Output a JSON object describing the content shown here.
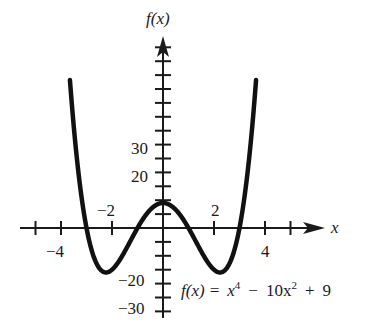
{
  "chart_data": {
    "type": "line",
    "title": "",
    "xlabel": "x",
    "ylabel": "f(x)",
    "equation": "f(x) = x^4 - 10x^2 + 9",
    "equation_parts": {
      "lhs": "f(x) =",
      "x4": "x",
      "exp4": "4",
      "minus": "−",
      "c10": "10x",
      "exp2": "2",
      "plus": "+",
      "nine": "9"
    },
    "x_tick_labels": [
      "−4",
      "−2",
      "2",
      "4"
    ],
    "x_tick_values": [
      -5,
      -4,
      -2,
      2,
      4,
      5
    ],
    "y_tick_labels": [
      "30",
      "20",
      "−20",
      "−30"
    ],
    "y_tick_step": 5,
    "xlim": [
      -5.2,
      6.5
    ],
    "ylim": [
      -32,
      72
    ],
    "grid": false,
    "legend": "none",
    "series": [
      {
        "name": "f(x) = x^4 - 10x^2 + 9",
        "x": [
          -3.65,
          -3.5,
          -3.25,
          -3.0,
          -2.75,
          -2.5,
          -2.236,
          -2.0,
          -1.75,
          -1.5,
          -1.25,
          -1.0,
          -0.75,
          -0.5,
          -0.25,
          0.0,
          0.25,
          0.5,
          0.75,
          1.0,
          1.25,
          1.5,
          1.75,
          2.0,
          2.236,
          2.5,
          2.75,
          3.0,
          3.25,
          3.5,
          3.65
        ],
        "y": [
          43.2,
          36.6,
          14.9,
          0.0,
          -9.4,
          -14.4,
          -16.0,
          -15.0,
          -11.2,
          -6.4,
          -0.2,
          0.0,
          3.7,
          6.6,
          8.4,
          9.0,
          8.4,
          6.6,
          3.7,
          0.0,
          -0.2,
          -6.4,
          -11.2,
          -15.0,
          -16.0,
          -14.4,
          -9.4,
          0.0,
          14.9,
          36.6,
          43.2
        ]
      }
    ],
    "key_points": {
      "roots": [
        -3,
        -1,
        1,
        3
      ],
      "local_max": [
        0,
        9
      ],
      "local_min": [
        [
          -2.236,
          -16
        ],
        [
          2.236,
          -16
        ]
      ]
    }
  },
  "labels": {
    "y_axis": "f(x)",
    "x_axis": "x",
    "x_ticks": {
      "m4": "−4",
      "m2": "−2",
      "p2": "2",
      "p4": "4"
    },
    "y_ticks": {
      "p30": "30",
      "p20": "20",
      "m20": "−20",
      "m30": "−30"
    }
  }
}
